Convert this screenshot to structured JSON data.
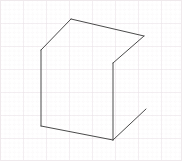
{
  "canvas": {
    "width": 182,
    "height": 161,
    "background_color": "#ffffff",
    "title": "Hand-drawn 3D box on graph paper"
  },
  "grid": {
    "name": "graph-paper-grid",
    "visible": true,
    "minor_spacing_px": 4.6,
    "major_spacing_px": 23,
    "minor_color": "#f3eef1",
    "major_color": "#e8dfe4",
    "border_color": "#efe9ec",
    "style": "dotted-minor-solid-major"
  },
  "drawing": {
    "name": "box-line-drawing",
    "stroke_color": "#4a4a4a",
    "stroke_width": 1,
    "stroke_linecap": "round",
    "stroke_linejoin": "round",
    "fill": "none",
    "vertices": {
      "apex_top": [
        71,
        19
      ],
      "left_upper": [
        41,
        50
      ],
      "right_upper": [
        144,
        36
      ],
      "notch_bottom": [
        113,
        63
      ],
      "bottom_left": [
        41,
        126
      ],
      "bottom_right": [
        113,
        140
      ],
      "stray_end": [
        146,
        109
      ]
    },
    "edges": [
      {
        "name": "edge-left-roof",
        "from": "left_upper",
        "to": "apex_top"
      },
      {
        "name": "edge-right-roof",
        "from": "apex_top",
        "to": "right_upper"
      },
      {
        "name": "edge-notch-diagonal",
        "from": "right_upper",
        "to": "notch_bottom"
      },
      {
        "name": "edge-front-right-vertical",
        "from": "notch_bottom",
        "to": "bottom_right"
      },
      {
        "name": "edge-front-left-vertical",
        "from": "left_upper",
        "to": "bottom_left"
      },
      {
        "name": "edge-bottom-front",
        "from": "bottom_left",
        "to": "bottom_right"
      },
      {
        "name": "edge-stray-diagonal",
        "from": "bottom_right",
        "to": "stray_end"
      }
    ],
    "path_main": "M 41 50 L 71 19 L 144 36 L 113 63 L 113 140 L 41 126 L 41 50",
    "path_stray": "M 113 140 L 146 109"
  }
}
